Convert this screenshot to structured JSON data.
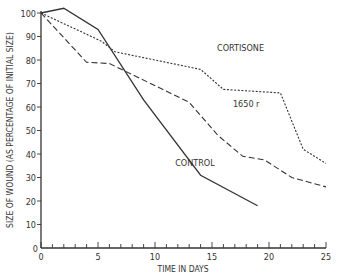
{
  "chart_data": {
    "type": "line",
    "title": "",
    "xlabel": "TIME IN DAYS",
    "ylabel": "SIZE OF WOUND (AS PERCENTAGE OF INITIAL SIZE)",
    "xlim": [
      0,
      25
    ],
    "ylim": [
      0,
      100
    ],
    "x_ticks": [
      0,
      5,
      10,
      15,
      20,
      25
    ],
    "y_ticks": [
      0,
      10,
      20,
      30,
      40,
      50,
      60,
      70,
      80,
      90,
      100
    ],
    "grid": false,
    "legend": "inline labels",
    "series": [
      {
        "name": "CONTROL",
        "style": "solid",
        "points": [
          [
            0,
            100
          ],
          [
            2,
            102
          ],
          [
            5,
            93
          ],
          [
            9,
            63
          ],
          [
            14,
            31
          ],
          [
            19,
            18
          ]
        ]
      },
      {
        "name": "CORTISONE",
        "style": "dotted",
        "points": [
          [
            0,
            100
          ],
          [
            5.3,
            88
          ],
          [
            6.5,
            83.5
          ],
          [
            14,
            76
          ],
          [
            16,
            67.5
          ],
          [
            21,
            66
          ],
          [
            23,
            42
          ],
          [
            25,
            36
          ]
        ]
      },
      {
        "name": "1650 r",
        "style": "dashed",
        "points": [
          [
            0,
            100
          ],
          [
            4,
            79
          ],
          [
            6,
            78.5
          ],
          [
            13,
            62
          ],
          [
            15.5,
            48
          ],
          [
            17.7,
            39
          ],
          [
            19.6,
            37.5
          ],
          [
            22,
            30
          ],
          [
            25,
            26
          ]
        ]
      }
    ],
    "annotations": [
      {
        "text": "CORTISONE",
        "x": 17.5,
        "y": 84
      },
      {
        "text": "1650 r",
        "x": 18,
        "y": 60
      },
      {
        "text": "CONTROL",
        "x": 13.5,
        "y": 35
      }
    ]
  }
}
